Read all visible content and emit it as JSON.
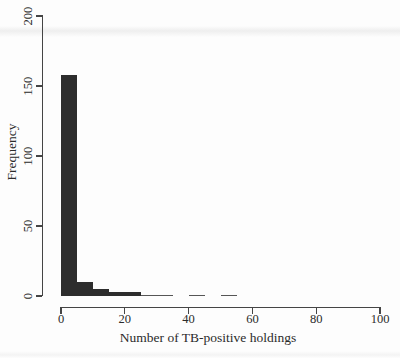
{
  "chart_data": {
    "type": "bar",
    "subtype": "histogram",
    "title": "",
    "xlabel": "Number of TB-positive holdings",
    "ylabel": "Frequency",
    "xlim": [
      0,
      100
    ],
    "ylim": [
      0,
      200
    ],
    "x_ticks": [
      0,
      20,
      40,
      60,
      80,
      100
    ],
    "y_ticks": [
      0,
      50,
      100,
      150,
      200
    ],
    "grid": false,
    "bin_width": 5,
    "bin_edges": [
      0,
      5,
      10,
      15,
      20,
      25,
      30,
      35,
      40,
      45,
      50,
      55
    ],
    "counts": [
      158,
      10,
      5,
      3,
      3,
      1,
      1,
      0,
      1,
      0,
      1
    ]
  },
  "colors": {
    "bar_fill": "#2d2d2d",
    "thin_bar_fill": "#565656",
    "axis": "#454545",
    "text": "#2b2b2b",
    "background": "#fdfdfd"
  }
}
